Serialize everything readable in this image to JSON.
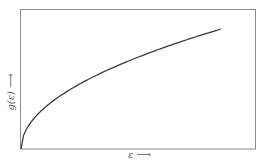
{
  "chart_data": {
    "type": "line",
    "title": "",
    "xlabel": "ε",
    "ylabel": "g(ε)",
    "xlabel_arrow": "⟶",
    "ylabel_arrow": "⟶",
    "ticks": "none",
    "grid": false,
    "legend": null,
    "function": "g(ε) ∝ √ε",
    "x": [
      0,
      0.05,
      0.1,
      0.2,
      0.3,
      0.4,
      0.5,
      0.6,
      0.7,
      0.8,
      0.9,
      1.0
    ],
    "values": [
      0,
      0.224,
      0.316,
      0.447,
      0.548,
      0.632,
      0.707,
      0.775,
      0.837,
      0.894,
      0.949,
      1.0
    ],
    "xlim": [
      0,
      1.17
    ],
    "ylim": [
      0,
      1.15
    ],
    "colors": {
      "line": "#3a3a3a",
      "frame": "#8a8a8a"
    }
  }
}
